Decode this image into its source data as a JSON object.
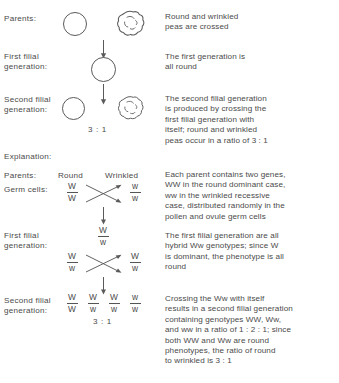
{
  "figure": {
    "title_section_labels": {
      "parents": "Parents:",
      "first_filial": "First filial\ngeneration:",
      "second_filial": "Second filial\ngeneration:",
      "explanation": "Explanation:",
      "parents_2": "Parents:",
      "germ_cells": "Germ cells:",
      "first_filial_2": "First filial\ngeneration:",
      "second_filial_2": "Second filial\ngeneration:"
    },
    "top_panel": {
      "column_icons": {
        "round_pea": "round-pea-icon",
        "wrinkled_pea": "wrinkled-pea-icon",
        "down_arrow": "down-arrow-icon"
      },
      "ratio_f2": "3 : 1",
      "descriptions": {
        "parents": "Round and wrinkled\npeas are crossed",
        "first_filial": "The first generation is\nall round",
        "second_filial": "The second filial generation\nis produced by crossing the\nfirst filial generation with\nitself; round and wrinkled\npeas occur in a ratio of 3 : 1"
      }
    },
    "bottom_panel": {
      "phenotype_headers": {
        "round": "Round",
        "wrinkled": "Wrinkled"
      },
      "germ_cells_row": {
        "left_genotype": {
          "num": "W",
          "den": "W"
        },
        "right_genotype": {
          "num": "w",
          "den": "w"
        },
        "cross_icon": "cross-arrows-icon"
      },
      "f1_row": {
        "genotype": {
          "num": "W",
          "den": "w"
        },
        "cross_genotype_left": {
          "num": "W",
          "den": "w"
        },
        "cross_genotype_right": {
          "num": "W",
          "den": "w"
        },
        "cross_icon": "cross-arrows-icon"
      },
      "f2_row": {
        "genotypes": [
          {
            "num": "W",
            "den": "W"
          },
          {
            "num": "W",
            "den": "w"
          },
          {
            "num": "W",
            "den": "w"
          },
          {
            "num": "w",
            "den": "w"
          }
        ],
        "ratio": "3 : 1"
      },
      "descriptions": {
        "parents": "Each parent contains two genes,\nWW in the round dominant case,\nww in the wrinkled recessive\ncase, distributed randomly in the\npollen and ovule germ cells",
        "first_filial": "The first filial generation are all\nhybrid Ww genotypes; since W\nis dominant, the phenotype is all\nround",
        "second_filial": "Crossing the Ww with itself\nresults in a second filial generation\ncontaining genotypes WW, Ww,\nand ww in a ratio of 1 : 2 : 1; since\nboth WW and Ww are round\nphenotypes, the ratio of round\nto wrinkled is 3 : 1"
      }
    },
    "colors": {
      "ink": "#4a4a4a",
      "stroke": "#5a5a5a",
      "background": "#ffffff"
    }
  }
}
